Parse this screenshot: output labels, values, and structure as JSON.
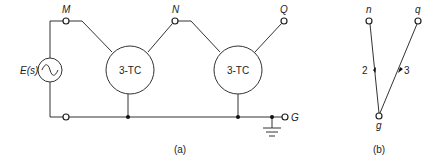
{
  "figure": {
    "part_a": {
      "caption": "(a)",
      "source_label": "E(s)",
      "source_symbol": "~",
      "nodes": {
        "M": "M",
        "N": "N",
        "Q": "Q",
        "G": "G"
      },
      "blocks": [
        {
          "label": "3-TC"
        },
        {
          "label": "3-TC"
        }
      ]
    },
    "part_b": {
      "caption": "(b)",
      "vertices": {
        "n": "n",
        "q": "q",
        "g": "g"
      },
      "edges": [
        {
          "from": "n",
          "to": "g",
          "label": "2"
        },
        {
          "from": "q",
          "to": "g",
          "label": "3"
        }
      ]
    }
  }
}
